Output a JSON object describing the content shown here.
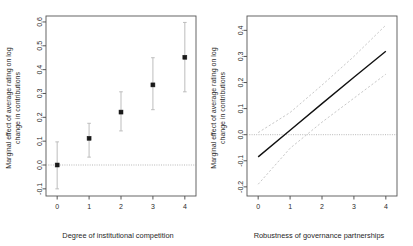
{
  "figure": {
    "background": "#ffffff",
    "point_color": "#1a1a1a",
    "errorbar_color": "#bdbdbd",
    "line_color": "#111111",
    "ci_color": "#c2c2c2",
    "zeroline_color": "#9a9a9a"
  },
  "chart_data": [
    {
      "type": "scatter",
      "panel": "left",
      "title": "",
      "xlabel": "Degree of institutional competition",
      "ylabel": "Marginal effect of average rating on log\nchange in contributions",
      "ylabel_line1": "Marginal effect of average rating on log",
      "ylabel_line2": "change in contributions",
      "x": [
        0,
        1,
        2,
        3,
        4
      ],
      "values": [
        0.0,
        0.112,
        0.222,
        0.336,
        0.452
      ],
      "ci_lower": [
        -0.1,
        0.033,
        0.143,
        0.232,
        0.307
      ],
      "ci_upper": [
        0.097,
        0.175,
        0.307,
        0.45,
        0.598
      ],
      "xticks": [
        0,
        1,
        2,
        3,
        4
      ],
      "xticklabels": [
        "0",
        "1",
        "2",
        "3",
        "4"
      ],
      "yticks": [
        -0.1,
        0.0,
        0.1,
        0.2,
        0.3,
        0.4,
        0.5,
        0.6
      ],
      "yticklabels": [
        "-0.1",
        "0.0",
        "0.1",
        "0.2",
        "0.3",
        "0.4",
        "0.5",
        "0.6"
      ],
      "xlim": [
        -0.35,
        4.35
      ],
      "ylim": [
        -0.13,
        0.625
      ],
      "grid": false,
      "zero_reference_line": 0.0,
      "legend": "none",
      "marker": "filled-square",
      "errorbar_style": "vertical-with-caps"
    },
    {
      "type": "line",
      "panel": "right",
      "title": "",
      "xlabel": "Robustness of governance partnerships",
      "ylabel": "Marginal effect of average rating on log\nchange in contributions",
      "ylabel_line1": "Marginal effect of average rating on log",
      "ylabel_line2": "change in contributions",
      "x": [
        0,
        1,
        2,
        3,
        4
      ],
      "series": [
        {
          "name": "Marginal effect",
          "style": "solid",
          "values": [
            -0.085,
            0.017,
            0.119,
            0.22,
            0.32
          ]
        },
        {
          "name": "Upper 95% CI",
          "style": "dashed",
          "values": [
            0.008,
            0.085,
            0.19,
            0.3,
            0.42
          ]
        },
        {
          "name": "Lower 95% CI",
          "style": "dashed",
          "values": [
            -0.19,
            -0.052,
            0.048,
            0.14,
            0.232
          ]
        }
      ],
      "xticks": [
        0,
        1,
        2,
        3,
        4
      ],
      "xticklabels": [
        "0",
        "1",
        "2",
        "3",
        "4"
      ],
      "yticks": [
        -0.2,
        -0.1,
        0.0,
        0.1,
        0.2,
        0.3,
        0.4
      ],
      "yticklabels": [
        "-0.2",
        "-0.1",
        "0.0",
        "0.1",
        "0.2",
        "0.3",
        "0.4"
      ],
      "xlim": [
        -0.35,
        4.35
      ],
      "ylim": [
        -0.235,
        0.455
      ],
      "grid": false,
      "zero_reference_line": 0.0,
      "legend": "none",
      "crossing_zero_at_x": 0.83
    }
  ]
}
